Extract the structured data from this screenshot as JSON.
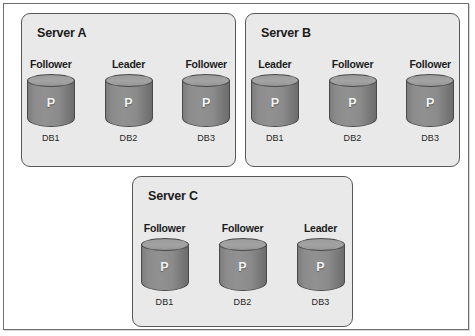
{
  "diagram": {
    "node_letter": "P",
    "colors": {
      "box_fill": "#e9e9e9",
      "box_border": "#585858",
      "cylinder_body": "#8c8c8c",
      "cylinder_top": "#a3a3a3",
      "cylinder_border": "#4a4a4a",
      "text": "#1c1c1c",
      "page_border": "#6e6e6e"
    },
    "servers": [
      {
        "id": "server-a",
        "title": "Server A",
        "nodes": [
          {
            "role": "Follower",
            "letter": "P",
            "db": "DB1"
          },
          {
            "role": "Leader",
            "letter": "P",
            "db": "DB2"
          },
          {
            "role": "Follower",
            "letter": "P",
            "db": "DB3"
          }
        ]
      },
      {
        "id": "server-b",
        "title": "Server B",
        "nodes": [
          {
            "role": "Leader",
            "letter": "P",
            "db": "DB1"
          },
          {
            "role": "Follower",
            "letter": "P",
            "db": "DB2"
          },
          {
            "role": "Follower",
            "letter": "P",
            "db": "DB3"
          }
        ]
      },
      {
        "id": "server-c",
        "title": "Server C",
        "nodes": [
          {
            "role": "Follower",
            "letter": "P",
            "db": "DB1"
          },
          {
            "role": "Follower",
            "letter": "P",
            "db": "DB2"
          },
          {
            "role": "Leader",
            "letter": "P",
            "db": "DB3"
          }
        ]
      }
    ]
  }
}
